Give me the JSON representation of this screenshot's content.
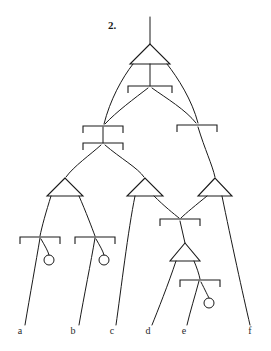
{
  "figure": {
    "number_label": "2.",
    "kind": "syntax-tree-diagram",
    "background_color": "#ffffff",
    "stroke_color": "#1a1a1a",
    "width": 271,
    "height": 351
  },
  "leaves": [
    {
      "id": "leaf-a",
      "label": "a",
      "x": 20,
      "y": 334
    },
    {
      "id": "leaf-b",
      "label": "b",
      "x": 73,
      "y": 334
    },
    {
      "id": "leaf-c",
      "label": "c",
      "x": 112,
      "y": 334
    },
    {
      "id": "leaf-d",
      "label": "d",
      "x": 148,
      "y": 334
    },
    {
      "id": "leaf-e",
      "label": "e",
      "x": 184,
      "y": 334
    },
    {
      "id": "leaf-f",
      "label": "f",
      "x": 250,
      "y": 334
    }
  ],
  "number_label_pos": {
    "x": 108,
    "y": 29
  },
  "triangles": [
    {
      "id": "triangle-root",
      "apex_x": 150,
      "apex_y": 44,
      "base_y": 64,
      "half_width": 20
    },
    {
      "id": "triangle-lower-left",
      "apex_x": 65,
      "apex_y": 178,
      "base_y": 196,
      "half_width": 18
    },
    {
      "id": "triangle-lower-mid",
      "apex_x": 145,
      "apex_y": 178,
      "base_y": 196,
      "half_width": 18
    },
    {
      "id": "triangle-lower-right",
      "apex_x": 215,
      "apex_y": 178,
      "base_y": 196,
      "half_width": 17
    },
    {
      "id": "triangle-small-e",
      "apex_x": 185,
      "apex_y": 243,
      "base_y": 261,
      "half_width": 15
    }
  ],
  "brackets": [
    {
      "id": "bracket-root-child",
      "center_x": 150,
      "y": 86,
      "half_width": 22,
      "tick": 7
    },
    {
      "id": "bracket-mid-left-upper",
      "center_x": 103,
      "y": 126,
      "half_width": 20,
      "tick": 7
    },
    {
      "id": "bracket-mid-left-lower",
      "center_x": 103,
      "y": 143,
      "half_width": 20,
      "tick": 7
    },
    {
      "id": "bracket-mid-right",
      "center_x": 197,
      "y": 125,
      "half_width": 20,
      "tick": 7
    },
    {
      "id": "bracket-a",
      "center_x": 40,
      "y": 237,
      "half_width": 20,
      "tick": 7
    },
    {
      "id": "bracket-b",
      "center_x": 95,
      "y": 237,
      "half_width": 20,
      "tick": 7
    },
    {
      "id": "bracket-de",
      "center_x": 180,
      "y": 219,
      "half_width": 20,
      "tick": 7
    },
    {
      "id": "bracket-e",
      "center_x": 200,
      "y": 280,
      "half_width": 20,
      "tick": 7
    }
  ],
  "empty_circles": [
    {
      "id": "circle-a",
      "cx": 49,
      "cy": 260,
      "r": 5
    },
    {
      "id": "circle-b",
      "cx": 104,
      "cy": 260,
      "r": 5
    },
    {
      "id": "circle-e",
      "cx": 209,
      "cy": 303,
      "r": 5
    }
  ],
  "branches": [
    {
      "id": "branch-root-stem",
      "d": "M150,17 L150,44"
    },
    {
      "id": "branch-root-to-bracket",
      "d": "M150,64 L150,86"
    },
    {
      "id": "branch-root-left-arc",
      "d": "M133,64 C122,78 110,100 104,124"
    },
    {
      "id": "branch-root-right-arc",
      "d": "M167,64 C178,78 192,100 198,123"
    },
    {
      "id": "branch-bracket-to-left",
      "d": "M148,88 C135,98 116,112 105,124"
    },
    {
      "id": "branch-bracket-to-right",
      "d": "M152,88 C166,98 186,110 196,123"
    },
    {
      "id": "branch-midleft-link",
      "d": "M103,127 L103,143"
    },
    {
      "id": "branch-midleft-to-tri-left",
      "d": "M101,145 C90,155 74,166 66,177"
    },
    {
      "id": "branch-midleft-to-tri-mid",
      "d": "M105,145 C120,158 138,168 144,177"
    },
    {
      "id": "branch-midright-to-tri-right",
      "d": "M198,127 C205,150 212,164 215,177"
    },
    {
      "id": "branch-tril-to-a",
      "d": "M51,196 C46,212 42,226 40,236"
    },
    {
      "id": "branch-tril-to-b",
      "d": "M79,196 C86,212 92,228 95,236"
    },
    {
      "id": "branch-a-down",
      "d": "M40,238 C36,262 30,295 25,325"
    },
    {
      "id": "branch-a-circle",
      "d": "M41,239 C45,246 48,251 49,255"
    },
    {
      "id": "branch-b-down",
      "d": "M95,238 C91,262 84,296 79,325"
    },
    {
      "id": "branch-b-circle",
      "d": "M96,239 C100,246 103,251 104,255"
    },
    {
      "id": "branch-trim-to-c",
      "d": "M135,196 C128,230 121,290 116,325"
    },
    {
      "id": "branch-trim-to-de",
      "d": "M154,196 C164,206 174,214 179,218"
    },
    {
      "id": "branch-trir-to-de",
      "d": "M207,196 C196,205 186,213 181,218"
    },
    {
      "id": "branch-trir-to-f",
      "d": "M222,196 C231,240 243,295 250,325"
    },
    {
      "id": "branch-de-to-smalltri",
      "d": "M180,221 L185,243"
    },
    {
      "id": "branch-smalltri-to-d",
      "d": "M176,261 C168,285 158,310 152,325"
    },
    {
      "id": "branch-smalltri-to-e",
      "d": "M194,261 C197,268 199,274 200,279"
    },
    {
      "id": "branch-e-down",
      "d": "M199,281 C195,296 190,312 187,325"
    },
    {
      "id": "branch-e-circle",
      "d": "M201,282 C205,290 208,296 209,298"
    }
  ]
}
